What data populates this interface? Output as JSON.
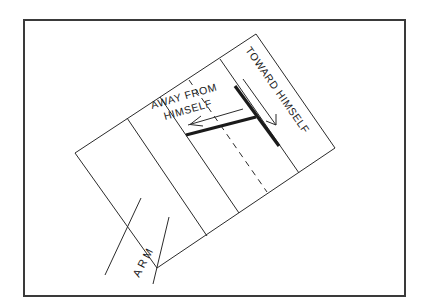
{
  "diagram": {
    "labels": {
      "away_line1": "AWAY FROM",
      "away_line2": "HIMSELF",
      "toward": "TOWARD HIMSELF",
      "arm": "ARM"
    },
    "colors": {
      "background": "#ffffff",
      "frame": "#3a3a3a",
      "lines": "#1a1a1a"
    }
  }
}
